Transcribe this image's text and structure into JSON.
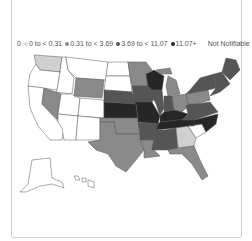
{
  "legend": {
    "zero_label": "0",
    "items": [
      {
        "label": "0 to < 0.31",
        "color": "#d9d9d9"
      },
      {
        "label": "0.31 to < 3.69",
        "color": "#8c8c8c"
      },
      {
        "label": "3.69 to < 11.07",
        "color": "#555555"
      },
      {
        "label": "11.07+",
        "color": "#222222"
      }
    ],
    "not_notifiable_label": "Not Notifiable"
  },
  "colors": {
    "zero": "#ffffff",
    "low": "#d0d0d0",
    "mid": "#8a8a8a",
    "high": "#555555",
    "top": "#262626",
    "border": "#555555"
  },
  "map": {
    "states": [
      {
        "id": "WA",
        "class": "low"
      },
      {
        "id": "OR",
        "class": "zero"
      },
      {
        "id": "CA",
        "class": "zero"
      },
      {
        "id": "ID",
        "class": "zero"
      },
      {
        "id": "NV",
        "class": "mid"
      },
      {
        "id": "MT",
        "class": "zero"
      },
      {
        "id": "WY",
        "class": "mid"
      },
      {
        "id": "UT",
        "class": "zero"
      },
      {
        "id": "AZ",
        "class": "zero"
      },
      {
        "id": "CO",
        "class": "zero"
      },
      {
        "id": "NM",
        "class": "zero"
      },
      {
        "id": "ND",
        "class": "zero"
      },
      {
        "id": "SD",
        "class": "zero"
      },
      {
        "id": "NE",
        "class": "high"
      },
      {
        "id": "KS",
        "class": "top"
      },
      {
        "id": "OK",
        "class": "mid"
      },
      {
        "id": "TX",
        "class": "mid"
      },
      {
        "id": "MN",
        "class": "mid"
      },
      {
        "id": "IA",
        "class": "high"
      },
      {
        "id": "MO",
        "class": "top"
      },
      {
        "id": "AR",
        "class": "high"
      },
      {
        "id": "LA",
        "class": "mid"
      },
      {
        "id": "WI",
        "class": "top"
      },
      {
        "id": "IL",
        "class": "high"
      },
      {
        "id": "MI",
        "class": "mid"
      },
      {
        "id": "IN",
        "class": "high"
      },
      {
        "id": "OH",
        "class": "mid"
      },
      {
        "id": "KY",
        "class": "top"
      },
      {
        "id": "TN",
        "class": "top"
      },
      {
        "id": "MS",
        "class": "high"
      },
      {
        "id": "AL",
        "class": "high"
      },
      {
        "id": "GA",
        "class": "low"
      },
      {
        "id": "FL",
        "class": "mid"
      },
      {
        "id": "SC",
        "class": "zero"
      },
      {
        "id": "NC",
        "class": "top"
      },
      {
        "id": "VA",
        "class": "high"
      },
      {
        "id": "WV",
        "class": "high"
      },
      {
        "id": "PA",
        "class": "mid"
      },
      {
        "id": "NY",
        "class": "high"
      },
      {
        "id": "ME",
        "class": "high"
      },
      {
        "id": "NE_ENG",
        "class": "high"
      },
      {
        "id": "AK",
        "class": "zero"
      },
      {
        "id": "HI",
        "class": "zero"
      }
    ]
  }
}
